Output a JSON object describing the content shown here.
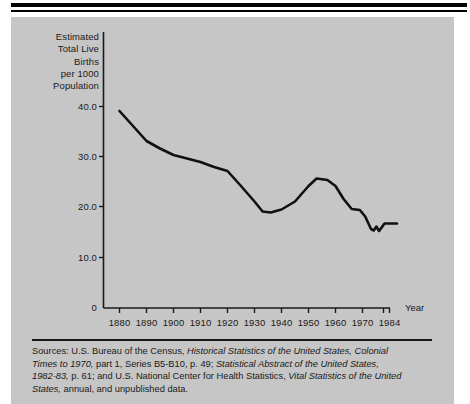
{
  "figure": {
    "background_color": "#c6c6c6",
    "page_color": "#ffffff",
    "ink_color": "#1a1a1a",
    "line_color": "#101010"
  },
  "axes": {
    "y_caption_lines": [
      "Estimated",
      "Total Live",
      "Births",
      "per 1000",
      "Population"
    ],
    "y_tick_labels": [
      "40.0",
      "30.0",
      "20.0",
      "10.0",
      "0"
    ],
    "x_tick_labels": [
      "1880",
      "1890",
      "1900",
      "1910",
      "1920",
      "1930",
      "1940",
      "1950",
      "1960",
      "1970",
      "1984"
    ],
    "x_axis_title": "Year"
  },
  "sources": {
    "lines": [
      [
        {
          "t": "Sources: U.S. Bureau of the Census, ",
          "i": false
        },
        {
          "t": "Historical Statistics of  the  United  States,  Colonial",
          "i": true
        }
      ],
      [
        {
          "t": "Times to 1970,",
          "i": true
        },
        {
          "t": " part 1, Series B5-B10, p. 49; ",
          "i": false
        },
        {
          "t": "Statistical Abstract of the United States,",
          "i": true
        }
      ],
      [
        {
          "t": "1982-83,",
          "i": true
        },
        {
          "t": " p. 61; and U.S. National Center for Health Statistics, ",
          "i": false
        },
        {
          "t": "Vital  Statistics of the United",
          "i": true
        }
      ],
      [
        {
          "t": "States,",
          "i": true
        },
        {
          "t": " annual, and unpublished data.",
          "i": false
        }
      ]
    ]
  },
  "chart_data": {
    "type": "line",
    "title": "",
    "xlabel": "Year",
    "ylabel": "Estimated Total Live Births per 1000 Population",
    "xlim": [
      1880,
      1984
    ],
    "ylim": [
      0,
      42
    ],
    "yticks": [
      0,
      10,
      20,
      30,
      40
    ],
    "xticks": [
      1880,
      1890,
      1900,
      1910,
      1920,
      1930,
      1940,
      1950,
      1960,
      1970,
      1984
    ],
    "grid": false,
    "legend": null,
    "series": [
      {
        "name": "Estimated total live births per 1000 population",
        "x": [
          1880,
          1885,
          1890,
          1895,
          1900,
          1905,
          1910,
          1915,
          1920,
          1925,
          1930,
          1933,
          1936,
          1940,
          1945,
          1950,
          1953,
          1957,
          1960,
          1963,
          1966,
          1969,
          1971,
          1973,
          1974,
          1975,
          1976,
          1978,
          1980,
          1984
        ],
        "values": [
          39.0,
          36.0,
          33.0,
          31.5,
          30.2,
          29.5,
          28.8,
          27.8,
          27.0,
          24.0,
          21.0,
          19.0,
          18.8,
          19.5,
          21.0,
          24.0,
          25.5,
          25.2,
          24.0,
          21.5,
          19.5,
          19.3,
          18.0,
          15.5,
          15.2,
          16.0,
          15.1,
          16.5,
          16.5,
          16.5
        ]
      }
    ]
  }
}
